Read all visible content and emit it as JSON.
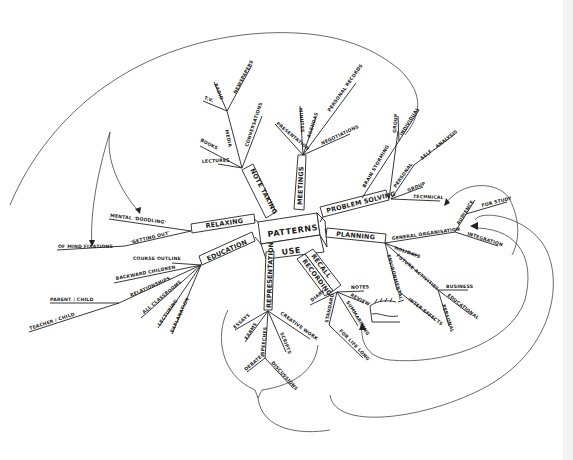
{
  "mind_map": {
    "center": {
      "top": "PATTERNS",
      "bottom": "USE"
    },
    "branches": {
      "note_taking": {
        "label": "NOTE TAKING",
        "children": [
          "LECTURES",
          "BOOKS",
          "MEDIA",
          "CONVERSATIONS"
        ],
        "media_children": [
          "T.V.",
          "RADIO",
          "NEWSPAPERS"
        ]
      },
      "meetings": {
        "label": "MEETINGS",
        "children": [
          "PRESENTATION",
          "MINUTES",
          "AGENDAS",
          "PERSONAL RECORDS",
          "NEGOTIATIONS"
        ]
      },
      "problem_solving": {
        "label": "PROBLEM SOLVING",
        "children": [
          "BRAIN STORMING",
          "PERSONAL",
          "GROUP",
          "TECHNICAL"
        ],
        "brainstorming_children": [
          "GROUP",
          "INDIVIDUAL"
        ],
        "personal_children": [
          "SELF - ANALYSIS"
        ]
      },
      "planning": {
        "label": "PLANNING",
        "children": [
          "GENERAL ORGANISATION",
          "HOLIDAYS",
          "FUTURE ACTIVITIES",
          "ENVIRONMENTAL",
          "INTER-EFFECTS"
        ],
        "general_children": [
          "AUDIENCE",
          "FOR STUDY",
          "INTEGRATION"
        ],
        "future_children": [
          "BUSINESS",
          "EDUCATIONAL",
          "PERSONAL"
        ]
      },
      "recall": {
        "label_1": "RECALL",
        "label_2": "RECORDING",
        "children": [
          "DIARY",
          "NOTES",
          "REVIEW",
          "SUMMARISING",
          "STANDARD",
          "FOR LIFE LONG"
        ]
      },
      "representation": {
        "label": "REPRESENTATION",
        "children": [
          "ESSAYS",
          "EXAMS",
          "SPEECHES",
          "CREATIVE WORK",
          "SCRIPTS",
          "DEBATES",
          "DISCUSSIONS"
        ]
      },
      "education": {
        "label": "EDUCATION",
        "children": [
          "COURSE OUTLINE",
          "BACKWARD CHILDREN",
          "RELATIONSHIPS",
          "ALL CLASSROOMS",
          "LECTURING",
          "EXPLANATION"
        ],
        "relationships_children": [
          "PARENT / CHILD",
          "TEACHER / CHILD"
        ]
      },
      "relaxing": {
        "label": "RELAXING",
        "children": [
          "MENTAL 'DOODLING'",
          "'GETTING OUT'"
        ],
        "getting_out_children": [
          "OF MIND FIXATIONS"
        ]
      }
    }
  }
}
